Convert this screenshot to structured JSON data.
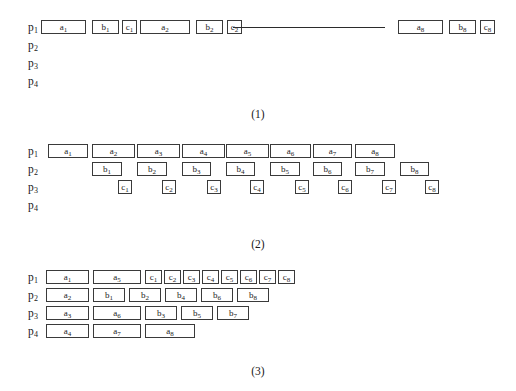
{
  "page": {
    "background": "#ffffff",
    "box_border_color": "#3a3a3a",
    "text_color": "#1a1a1a"
  },
  "figures": [
    {
      "id": "figure-1",
      "caption": "(1)",
      "caption_top": 108,
      "top": 18,
      "row_labels": [
        "p1",
        "p2",
        "p3",
        "p4"
      ],
      "row_label_parts": [
        {
          "base": "p",
          "sub": "1"
        },
        {
          "base": "p",
          "sub": "2"
        },
        {
          "base": "p",
          "sub": "3"
        },
        {
          "base": "p",
          "sub": "4"
        }
      ],
      "ellipsis_line": {
        "row": 0,
        "x": 233,
        "width": 152
      },
      "cells": [
        {
          "row": 0,
          "x": 41,
          "w": 45,
          "base": "a",
          "sub": "1"
        },
        {
          "row": 0,
          "x": 92,
          "w": 27,
          "base": "b",
          "sub": "1"
        },
        {
          "row": 0,
          "x": 122,
          "w": 15,
          "base": "c",
          "sub": "1"
        },
        {
          "row": 0,
          "x": 140,
          "w": 50,
          "base": "a",
          "sub": "2"
        },
        {
          "row": 0,
          "x": 196,
          "w": 27,
          "base": "b",
          "sub": "2"
        },
        {
          "row": 0,
          "x": 227,
          "w": 15,
          "base": "c",
          "sub": "2"
        },
        {
          "row": 0,
          "x": 398,
          "w": 45,
          "base": "a",
          "sub": "8"
        },
        {
          "row": 0,
          "x": 449,
          "w": 27,
          "base": "b",
          "sub": "8"
        },
        {
          "row": 0,
          "x": 480,
          "w": 15,
          "base": "c",
          "sub": "8"
        }
      ]
    },
    {
      "id": "figure-2",
      "caption": "(2)",
      "caption_top": 238,
      "top": 142,
      "row_labels": [
        "p1",
        "p2",
        "p3",
        "p4"
      ],
      "row_label_parts": [
        {
          "base": "p",
          "sub": "1"
        },
        {
          "base": "p",
          "sub": "2"
        },
        {
          "base": "p",
          "sub": "3"
        },
        {
          "base": "p",
          "sub": "4"
        }
      ],
      "ellipsis_line": null,
      "cells": [
        {
          "row": 0,
          "x": 48,
          "w": 40,
          "base": "a",
          "sub": "1"
        },
        {
          "row": 0,
          "x": 92,
          "w": 43,
          "base": "a",
          "sub": "2"
        },
        {
          "row": 0,
          "x": 137,
          "w": 43,
          "base": "a",
          "sub": "3"
        },
        {
          "row": 0,
          "x": 182,
          "w": 43,
          "base": "a",
          "sub": "4"
        },
        {
          "row": 0,
          "x": 226,
          "w": 43,
          "base": "a",
          "sub": "5"
        },
        {
          "row": 0,
          "x": 270,
          "w": 41,
          "base": "a",
          "sub": "6"
        },
        {
          "row": 0,
          "x": 313,
          "w": 39,
          "base": "a",
          "sub": "7"
        },
        {
          "row": 0,
          "x": 355,
          "w": 40,
          "base": "a",
          "sub": "8"
        },
        {
          "row": 1,
          "x": 92,
          "w": 30,
          "base": "b",
          "sub": "1"
        },
        {
          "row": 1,
          "x": 137,
          "w": 30,
          "base": "b",
          "sub": "2"
        },
        {
          "row": 1,
          "x": 182,
          "w": 29,
          "base": "b",
          "sub": "3"
        },
        {
          "row": 1,
          "x": 226,
          "w": 29,
          "base": "b",
          "sub": "4"
        },
        {
          "row": 1,
          "x": 270,
          "w": 30,
          "base": "b",
          "sub": "5"
        },
        {
          "row": 1,
          "x": 313,
          "w": 29,
          "base": "b",
          "sub": "6"
        },
        {
          "row": 1,
          "x": 355,
          "w": 30,
          "base": "b",
          "sub": "7"
        },
        {
          "row": 1,
          "x": 400,
          "w": 29,
          "base": "b",
          "sub": "8"
        },
        {
          "row": 2,
          "x": 118,
          "w": 14,
          "base": "c",
          "sub": "1"
        },
        {
          "row": 2,
          "x": 162,
          "w": 14,
          "base": "c",
          "sub": "2"
        },
        {
          "row": 2,
          "x": 207,
          "w": 14,
          "base": "c",
          "sub": "3"
        },
        {
          "row": 2,
          "x": 250,
          "w": 14,
          "base": "c",
          "sub": "4"
        },
        {
          "row": 2,
          "x": 295,
          "w": 14,
          "base": "c",
          "sub": "5"
        },
        {
          "row": 2,
          "x": 338,
          "w": 14,
          "base": "c",
          "sub": "6"
        },
        {
          "row": 2,
          "x": 382,
          "w": 14,
          "base": "c",
          "sub": "7"
        },
        {
          "row": 2,
          "x": 425,
          "w": 14,
          "base": "c",
          "sub": "8"
        }
      ]
    },
    {
      "id": "figure-3",
      "caption": "(3)",
      "caption_top": 365,
      "top": 268,
      "row_labels": [
        "p1",
        "p2",
        "p3",
        "p4"
      ],
      "row_label_parts": [
        {
          "base": "p",
          "sub": "1"
        },
        {
          "base": "p",
          "sub": "2"
        },
        {
          "base": "p",
          "sub": "3"
        },
        {
          "base": "p",
          "sub": "4"
        }
      ],
      "ellipsis_line": null,
      "cells": [
        {
          "row": 0,
          "x": 46,
          "w": 43,
          "base": "a",
          "sub": "1"
        },
        {
          "row": 0,
          "x": 93,
          "w": 48,
          "base": "a",
          "sub": "5"
        },
        {
          "row": 0,
          "x": 145,
          "w": 17,
          "base": "c",
          "sub": "1"
        },
        {
          "row": 0,
          "x": 164,
          "w": 17,
          "base": "c",
          "sub": "2"
        },
        {
          "row": 0,
          "x": 183,
          "w": 17,
          "base": "c",
          "sub": "3"
        },
        {
          "row": 0,
          "x": 202,
          "w": 17,
          "base": "c",
          "sub": "4"
        },
        {
          "row": 0,
          "x": 221,
          "w": 17,
          "base": "c",
          "sub": "5"
        },
        {
          "row": 0,
          "x": 240,
          "w": 17,
          "base": "c",
          "sub": "6"
        },
        {
          "row": 0,
          "x": 259,
          "w": 17,
          "base": "c",
          "sub": "7"
        },
        {
          "row": 0,
          "x": 278,
          "w": 17,
          "base": "c",
          "sub": "8"
        },
        {
          "row": 1,
          "x": 46,
          "w": 43,
          "base": "a",
          "sub": "2"
        },
        {
          "row": 1,
          "x": 93,
          "w": 32,
          "base": "b",
          "sub": "1"
        },
        {
          "row": 1,
          "x": 129,
          "w": 32,
          "base": "b",
          "sub": "2"
        },
        {
          "row": 1,
          "x": 165,
          "w": 32,
          "base": "b",
          "sub": "4"
        },
        {
          "row": 1,
          "x": 201,
          "w": 32,
          "base": "b",
          "sub": "6"
        },
        {
          "row": 1,
          "x": 237,
          "w": 32,
          "base": "b",
          "sub": "8"
        },
        {
          "row": 2,
          "x": 46,
          "w": 43,
          "base": "a",
          "sub": "3"
        },
        {
          "row": 2,
          "x": 93,
          "w": 48,
          "base": "a",
          "sub": "6"
        },
        {
          "row": 2,
          "x": 145,
          "w": 32,
          "base": "b",
          "sub": "3"
        },
        {
          "row": 2,
          "x": 181,
          "w": 32,
          "base": "b",
          "sub": "5"
        },
        {
          "row": 2,
          "x": 217,
          "w": 32,
          "base": "b",
          "sub": "7"
        },
        {
          "row": 3,
          "x": 46,
          "w": 43,
          "base": "a",
          "sub": "4"
        },
        {
          "row": 3,
          "x": 93,
          "w": 48,
          "base": "a",
          "sub": "7"
        },
        {
          "row": 3,
          "x": 145,
          "w": 50,
          "base": "a",
          "sub": "8"
        }
      ]
    }
  ]
}
